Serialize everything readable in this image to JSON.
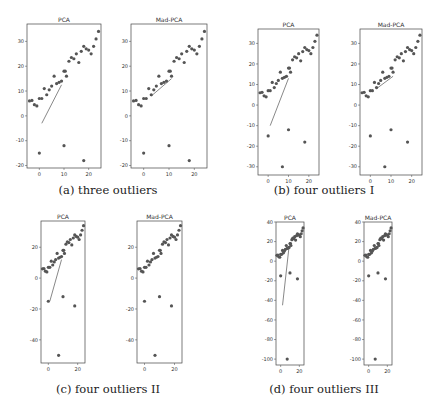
{
  "figure": {
    "panels": [
      {
        "id": "a",
        "caption": "(a) three outliers"
      },
      {
        "id": "b",
        "caption": "(b) four outliers I"
      },
      {
        "id": "c",
        "caption": "(c) four outliers II"
      },
      {
        "id": "d",
        "caption": "(d) four outliers III"
      }
    ],
    "subplot_titles": [
      "PCA",
      "Mad-PCA"
    ]
  },
  "chart_data": [
    {
      "type": "scatter",
      "panel": "a",
      "caption": "(a) three outliers",
      "xlim": [
        -5,
        25
      ],
      "ylim": [
        -21,
        37
      ],
      "xticks": [
        0,
        10,
        20
      ],
      "yticks": [
        -20,
        -10,
        0,
        10,
        20,
        30
      ],
      "inliers": [
        [
          -4,
          6
        ],
        [
          -3,
          6.2
        ],
        [
          -2,
          4.5
        ],
        [
          -1,
          4
        ],
        [
          0,
          7
        ],
        [
          1,
          7
        ],
        [
          2,
          11
        ],
        [
          3,
          8.5
        ],
        [
          4,
          10.5
        ],
        [
          5,
          12
        ],
        [
          6,
          16
        ],
        [
          7,
          13
        ],
        [
          8,
          13.5
        ],
        [
          9,
          14
        ],
        [
          10,
          18
        ],
        [
          10.5,
          18
        ],
        [
          11,
          16
        ],
        [
          12,
          22
        ],
        [
          13,
          23.5
        ],
        [
          14,
          23
        ],
        [
          15,
          25
        ],
        [
          16,
          21.5
        ],
        [
          17,
          26
        ],
        [
          18,
          28
        ],
        [
          19,
          27
        ],
        [
          20,
          26.5
        ],
        [
          21,
          25
        ],
        [
          22,
          28
        ],
        [
          23,
          31
        ],
        [
          24,
          34
        ]
      ],
      "outliers": [
        [
          0,
          -15
        ],
        [
          10,
          -12
        ],
        [
          18,
          -18
        ]
      ],
      "subplots": [
        {
          "title": "PCA",
          "line": [
            [
              1,
              -3
            ],
            [
              9,
              12.5
            ]
          ]
        },
        {
          "title": "Mad-PCA",
          "line": [
            [
              3,
              8
            ],
            [
              11,
              15
            ]
          ]
        }
      ]
    },
    {
      "type": "scatter",
      "panel": "b",
      "caption": "(b) four outliers I",
      "xlim": [
        -5,
        25
      ],
      "ylim": [
        -34,
        37
      ],
      "xticks": [
        0,
        10,
        20
      ],
      "yticks": [
        -30,
        -20,
        -10,
        0,
        10,
        20,
        30
      ],
      "inliers": [
        [
          -4,
          6
        ],
        [
          -3,
          6.2
        ],
        [
          -2,
          4.5
        ],
        [
          -1,
          4
        ],
        [
          0,
          7
        ],
        [
          1,
          7
        ],
        [
          2,
          11
        ],
        [
          3,
          8.5
        ],
        [
          4,
          10.5
        ],
        [
          5,
          12
        ],
        [
          6,
          16
        ],
        [
          7,
          13
        ],
        [
          8,
          13.5
        ],
        [
          9,
          14
        ],
        [
          10,
          18
        ],
        [
          10.5,
          18
        ],
        [
          11,
          16
        ],
        [
          12,
          22
        ],
        [
          13,
          23.5
        ],
        [
          14,
          23
        ],
        [
          15,
          25
        ],
        [
          16,
          21.5
        ],
        [
          17,
          26
        ],
        [
          18,
          28
        ],
        [
          19,
          27
        ],
        [
          20,
          26.5
        ],
        [
          21,
          25
        ],
        [
          22,
          28
        ],
        [
          23,
          31
        ],
        [
          24,
          34
        ]
      ],
      "outliers": [
        [
          0,
          -15
        ],
        [
          10,
          -12
        ],
        [
          18,
          -18
        ],
        [
          7,
          -30
        ]
      ],
      "subplots": [
        {
          "title": "PCA",
          "line": [
            [
              1,
              -10
            ],
            [
              10,
              13
            ]
          ]
        },
        {
          "title": "Mad-PCA",
          "line": [
            [
              3,
              8
            ],
            [
              11,
              14
            ]
          ]
        }
      ]
    },
    {
      "type": "scatter",
      "panel": "c",
      "caption": "(c) four outliers II",
      "xlim": [
        -5,
        25
      ],
      "ylim": [
        -55,
        37
      ],
      "xticks": [
        0,
        20
      ],
      "yticks": [
        -40,
        -20,
        0,
        20
      ],
      "inliers": [
        [
          -4,
          6
        ],
        [
          -3,
          6.2
        ],
        [
          -2,
          4.5
        ],
        [
          -1,
          4
        ],
        [
          0,
          7
        ],
        [
          1,
          7
        ],
        [
          2,
          11
        ],
        [
          3,
          8.5
        ],
        [
          4,
          10.5
        ],
        [
          5,
          12
        ],
        [
          6,
          16
        ],
        [
          7,
          13
        ],
        [
          8,
          13.5
        ],
        [
          9,
          14
        ],
        [
          10,
          18
        ],
        [
          10.5,
          18
        ],
        [
          11,
          16
        ],
        [
          12,
          22
        ],
        [
          13,
          23.5
        ],
        [
          14,
          23
        ],
        [
          15,
          25
        ],
        [
          16,
          21.5
        ],
        [
          17,
          26
        ],
        [
          18,
          28
        ],
        [
          19,
          27
        ],
        [
          20,
          26.5
        ],
        [
          21,
          25
        ],
        [
          22,
          28
        ],
        [
          23,
          31
        ],
        [
          24,
          34
        ]
      ],
      "outliers": [
        [
          0,
          -15
        ],
        [
          10,
          -12
        ],
        [
          18,
          -18
        ],
        [
          7,
          -50
        ]
      ],
      "subplots": [
        {
          "title": "PCA",
          "line": [
            [
              1,
              -15
            ],
            [
              9,
              12
            ]
          ]
        },
        {
          "title": "Mad-PCA",
          "line": null
        }
      ]
    },
    {
      "type": "scatter",
      "panel": "d",
      "caption": "(d) four outliers III",
      "xlim": [
        -5,
        25
      ],
      "ylim": [
        -106,
        40
      ],
      "xticks": [
        0,
        20
      ],
      "yticks": [
        -100,
        -80,
        -60,
        -40,
        -20,
        0,
        20,
        40
      ],
      "inliers": [
        [
          -4,
          6
        ],
        [
          -3,
          6.2
        ],
        [
          -2,
          4.5
        ],
        [
          -1,
          4
        ],
        [
          0,
          7
        ],
        [
          1,
          7
        ],
        [
          2,
          11
        ],
        [
          3,
          8.5
        ],
        [
          4,
          10.5
        ],
        [
          5,
          12
        ],
        [
          6,
          16
        ],
        [
          7,
          13
        ],
        [
          8,
          13.5
        ],
        [
          9,
          14
        ],
        [
          10,
          18
        ],
        [
          10.5,
          18
        ],
        [
          11,
          16
        ],
        [
          12,
          22
        ],
        [
          13,
          23.5
        ],
        [
          14,
          23
        ],
        [
          15,
          25
        ],
        [
          16,
          21.5
        ],
        [
          17,
          26
        ],
        [
          18,
          28
        ],
        [
          19,
          27
        ],
        [
          20,
          26.5
        ],
        [
          21,
          25
        ],
        [
          22,
          28
        ],
        [
          23,
          31
        ],
        [
          24,
          34
        ]
      ],
      "outliers": [
        [
          0,
          -15
        ],
        [
          10,
          -12
        ],
        [
          18,
          -18
        ],
        [
          7,
          -100
        ]
      ],
      "subplots": [
        {
          "title": "PCA",
          "line": [
            [
              2,
              -45
            ],
            [
              9,
              15
            ]
          ]
        },
        {
          "title": "Mad-PCA",
          "line": null
        }
      ]
    }
  ]
}
